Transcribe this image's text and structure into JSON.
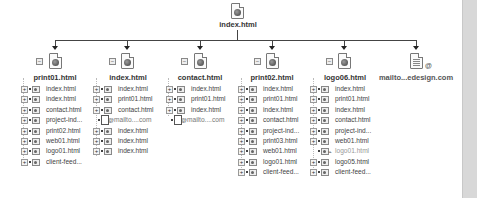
{
  "root": {
    "label": "index.html",
    "icon": "html-page-icon"
  },
  "colors": {
    "line": "#444444",
    "text": "#3a3a3a",
    "broken_text": "#999999",
    "scrollbar": "#d8d8d8"
  },
  "children": [
    {
      "label": "print01.html",
      "icon": "html-page-icon",
      "expanded": true,
      "links": [
        {
          "label": "index.html",
          "type": "page"
        },
        {
          "label": "index.html",
          "type": "page"
        },
        {
          "label": "contact.html",
          "type": "page"
        },
        {
          "label": "project-ind...",
          "type": "page"
        },
        {
          "label": "print02.html",
          "type": "page"
        },
        {
          "label": "web01.html",
          "type": "page"
        },
        {
          "label": "logo01.html",
          "type": "page"
        },
        {
          "label": "client-feed...",
          "type": "page"
        }
      ]
    },
    {
      "label": "index.html",
      "icon": "html-page-icon",
      "expanded": true,
      "links": [
        {
          "label": "index.html",
          "type": "page"
        },
        {
          "label": "print01.html",
          "type": "page"
        },
        {
          "label": "contact.html",
          "type": "page"
        },
        {
          "label": "mailto....com",
          "type": "mail"
        },
        {
          "label": "index.html",
          "type": "page"
        },
        {
          "label": "index.html",
          "type": "page"
        },
        {
          "label": "index.html",
          "type": "page"
        }
      ]
    },
    {
      "label": "contact.html",
      "icon": "html-page-icon",
      "expanded": true,
      "links": [
        {
          "label": "index.html",
          "type": "page"
        },
        {
          "label": "print01.html",
          "type": "page"
        },
        {
          "label": "index.html",
          "type": "page"
        },
        {
          "label": "mailto....com",
          "type": "mail"
        }
      ]
    },
    {
      "label": "print02.html",
      "icon": "html-page-icon",
      "expanded": true,
      "links": [
        {
          "label": "index.html",
          "type": "page"
        },
        {
          "label": "print01.html",
          "type": "page"
        },
        {
          "label": "index.html",
          "type": "page"
        },
        {
          "label": "contact.html",
          "type": "page"
        },
        {
          "label": "project-ind...",
          "type": "page"
        },
        {
          "label": "print03.html",
          "type": "page"
        },
        {
          "label": "web01.html",
          "type": "page"
        },
        {
          "label": "logo01.html",
          "type": "page"
        },
        {
          "label": "client-feed...",
          "type": "page"
        }
      ]
    },
    {
      "label": "logo06.html",
      "icon": "html-page-icon",
      "expanded": true,
      "links": [
        {
          "label": "index.html",
          "type": "page"
        },
        {
          "label": "print01.html",
          "type": "page"
        },
        {
          "label": "index.html",
          "type": "page"
        },
        {
          "label": "contact.html",
          "type": "page"
        },
        {
          "label": "project-ind...",
          "type": "page"
        },
        {
          "label": "web01.html",
          "type": "page"
        },
        {
          "label": "logo01.html",
          "type": "broken"
        },
        {
          "label": "logo05.html",
          "type": "page"
        },
        {
          "label": "client-feed...",
          "type": "page"
        }
      ]
    },
    {
      "label": "mailto...edesign.com",
      "icon": "mailto-document-icon",
      "expanded": false,
      "links": []
    }
  ]
}
